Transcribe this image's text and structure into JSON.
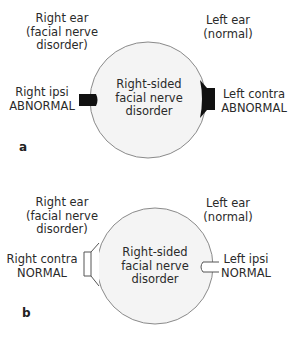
{
  "colors": {
    "circle_fill": "#f4f4f4",
    "circle_stroke": "#8a8a8a",
    "abnormal_fill": "#111111",
    "normal_fill": "#ffffff",
    "text": "#2a2a2a"
  },
  "panels": [
    {
      "letter": "a",
      "right_ear": {
        "line1": "Right ear",
        "line2": "(facial nerve",
        "line3": "disorder)"
      },
      "left_ear": {
        "line1": "Left ear",
        "line2": "(normal)"
      },
      "center": {
        "line1": "Right-sided",
        "line2": "facial nerve",
        "line3": "disorder"
      },
      "left_probe": {
        "line1": "Right ipsi",
        "line2": "ABNORMAL",
        "status": "abnormal",
        "shape": "bar"
      },
      "right_probe": {
        "line1": "Left contra",
        "line2": "ABNORMAL",
        "status": "abnormal",
        "shape": "horn"
      }
    },
    {
      "letter": "b",
      "right_ear": {
        "line1": "Right ear",
        "line2": "(facial nerve",
        "line3": "disorder)"
      },
      "left_ear": {
        "line1": "Left ear",
        "line2": "(normal)"
      },
      "center": {
        "line1": "Right-sided",
        "line2": "facial nerve",
        "line3": "disorder"
      },
      "left_probe": {
        "line1": "Right contra",
        "line2": "NORMAL",
        "status": "normal",
        "shape": "horn"
      },
      "right_probe": {
        "line1": "Left ipsi",
        "line2": "NORMAL",
        "status": "normal",
        "shape": "bar"
      }
    }
  ]
}
